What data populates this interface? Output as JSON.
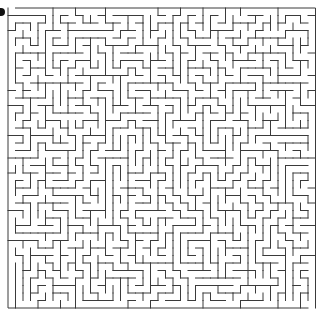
{
  "maze": {
    "cols": 41,
    "rows": 40,
    "origin_x": 8,
    "origin_y": 8,
    "cell_size": 7.5,
    "wall_color": "#3a3a3a",
    "wall_width": 1,
    "background": "#ffffff",
    "seed": 20240611
  },
  "start_marker": {
    "icon": "start-marker-icon",
    "x": 0,
    "y": 8,
    "color": "#111111"
  }
}
